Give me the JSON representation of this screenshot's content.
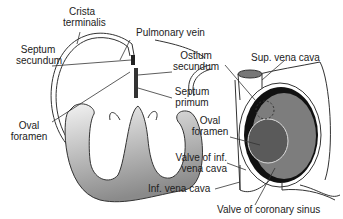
{
  "figure": {
    "left_panel": {
      "name": "fetal heart cross-section",
      "labels": {
        "crista_1": "Crista",
        "crista_2": "terminalis",
        "septum_sec_1": "Septum",
        "septum_sec_2": "secundum",
        "pulmonary_vein": "Pulmonary vein",
        "ostium_1": "Ostium",
        "ostium_2": "secundum",
        "septum_prim_1": "Septum",
        "septum_prim_2": "primum",
        "oval_1": "Oval",
        "oval_2": "foramen"
      }
    },
    "right_panel": {
      "name": "right atrium interior view",
      "labels": {
        "sup_vena_cava": "Sup. vena cava",
        "oval_1": "Oval",
        "oval_2": "foramen",
        "valve_inf_1": "Valve of inf.",
        "valve_inf_2": "vena cava",
        "inf_vena_cava": "Inf. vena cava",
        "valve_coronary": "Valve of coronary sinus"
      }
    },
    "colors": {
      "outline": "#333333",
      "ventricle_fill_light": "#e6e6e6",
      "ventricle_fill_dark": "#8f8f8f",
      "atrium_wall": "#7a7a7a",
      "oval_foramen": "#5a5a5a",
      "black_muscle": "#111111"
    }
  }
}
